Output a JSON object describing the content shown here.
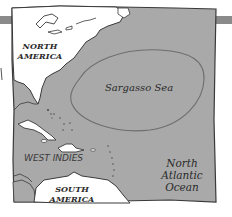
{
  "map": {
    "colors": {
      "ocean": "#a9a9a9",
      "land": "#ffffff",
      "border": "#3a3a3a",
      "sargasso_outline": "#6e6e6e",
      "tab": "#8a8a8a"
    },
    "labels": {
      "north_america": [
        "NORTH",
        "AMERICA"
      ],
      "sargasso_sea": "Sargasso Sea",
      "west_indies": "WEST INDIES",
      "north_atlantic": [
        "North",
        "Atlantic",
        "Ocean"
      ],
      "south_america": [
        "SOUTH",
        "AMERICA"
      ]
    }
  }
}
